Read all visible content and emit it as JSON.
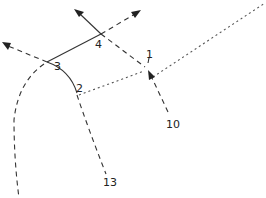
{
  "diagram": {
    "type": "traffic-flow-sketch",
    "nodes": [
      {
        "id": "1",
        "label": "1",
        "x": 147,
        "y": 70
      },
      {
        "id": "2",
        "label": "2",
        "x": 77,
        "y": 95
      },
      {
        "id": "3",
        "label": "3",
        "x": 47,
        "y": 62
      },
      {
        "id": "4",
        "label": "4",
        "x": 101,
        "y": 34
      },
      {
        "id": "10",
        "label": "10",
        "x": 172,
        "y": 123
      },
      {
        "id": "13",
        "label": "13",
        "x": 108,
        "y": 182
      }
    ],
    "edges": [
      {
        "from": "3",
        "to": "4",
        "style": "solid"
      },
      {
        "from": "3",
        "to": "2",
        "style": "solid",
        "shape": "curve"
      },
      {
        "from": "4",
        "to": "1",
        "style": "dashed"
      },
      {
        "from": "2",
        "to": "1",
        "style": "dotted"
      },
      {
        "from": "1",
        "to": "off-top-right",
        "style": "dotted"
      },
      {
        "from": "10",
        "to": "1",
        "style": "dashed",
        "arrow": "end"
      },
      {
        "from": "2",
        "to": "13",
        "style": "dashed"
      },
      {
        "from": "3",
        "to": "off-left",
        "style": "dashed",
        "arrow": "end"
      },
      {
        "from": "4",
        "to": "off-up-left",
        "style": "solid",
        "arrow": "end"
      },
      {
        "from": "4",
        "to": "off-up-right",
        "style": "dashed",
        "arrow": "end"
      },
      {
        "from": "3",
        "to": "off-bottom-left",
        "style": "dashed",
        "shape": "curve"
      }
    ],
    "labels": {
      "n1": "1",
      "n2": "2",
      "n3": "3",
      "n4": "4",
      "n10": "10",
      "n13": "13"
    }
  }
}
